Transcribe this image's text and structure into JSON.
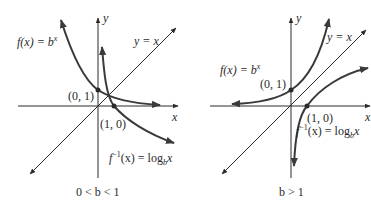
{
  "left_graph": {
    "axis_x_label": "x",
    "axis_y_label": "y",
    "line_label": "y = x",
    "f_label_prefix": "f(x) = b",
    "f_label_exp": "x",
    "inv_label_prefix": "f",
    "inv_label_exp": "−1",
    "inv_label_mid": "(x) = log",
    "inv_label_sub": "b",
    "inv_label_suffix": "x",
    "point_f": "(0, 1)",
    "point_inv": "(1, 0)",
    "caption": "0 < b < 1"
  },
  "right_graph": {
    "axis_x_label": "x",
    "axis_y_label": "y",
    "line_label": "y = x",
    "f_label_prefix": "f(x) = b",
    "f_label_exp": "x",
    "inv_label_prefix": "f",
    "inv_label_exp": "−1",
    "inv_label_mid": "(x) = log",
    "inv_label_sub": "b",
    "inv_label_suffix": "x",
    "point_f": "(0, 1)",
    "point_inv": "(1, 0)",
    "caption": "b > 1"
  },
  "colors": {
    "curve": "#3a3a3a",
    "axis": "#2a2a2a",
    "text": "#2a2a2a"
  }
}
